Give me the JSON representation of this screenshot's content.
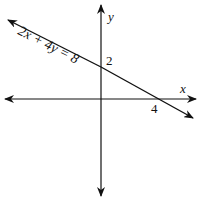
{
  "figure": {
    "equation": "2x + 4y = 8",
    "x_axis_label": "x",
    "y_axis_label": "y",
    "y_intercept_label": "2",
    "x_intercept_label": "4",
    "line_color": "#111111",
    "axis_color": "#111111"
  }
}
